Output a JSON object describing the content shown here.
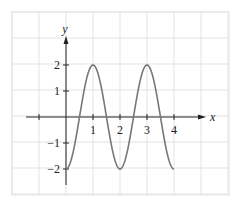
{
  "chart_data": {
    "type": "line",
    "title": "",
    "xlabel": "x",
    "ylabel": "y",
    "function": "y = -2cos(πx)",
    "x_range": [
      0,
      4
    ],
    "xlim": [
      -2,
      5.9
    ],
    "ylim": [
      -2.9,
      3.9
    ],
    "x_ticks": [
      -1,
      1,
      2,
      3,
      4
    ],
    "x_tick_labels": [
      "1",
      "2",
      "3",
      "4"
    ],
    "y_ticks": [
      2,
      1,
      -1,
      -2
    ],
    "y_tick_labels": [
      "2",
      "1",
      "−1",
      "−2"
    ],
    "grid": true,
    "series": [
      {
        "name": "curve",
        "x": [
          0,
          0.5,
          1,
          1.5,
          2,
          2.5,
          3,
          3.5,
          4
        ],
        "values": [
          -2,
          0,
          2,
          0,
          -2,
          0,
          2,
          0,
          -2
        ]
      }
    ],
    "colors": {
      "curve": "#777777",
      "axis": "#222222",
      "grid": "#e3e3e3"
    }
  }
}
